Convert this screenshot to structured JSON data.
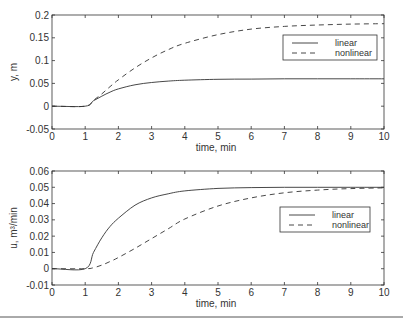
{
  "chart_data": [
    {
      "type": "line",
      "title": "",
      "xlabel": "time, min",
      "ylabel": "y, m",
      "xlim": [
        0,
        10
      ],
      "ylim": [
        -0.05,
        0.2
      ],
      "xticks": [
        "0",
        "1",
        "2",
        "3",
        "4",
        "5",
        "6",
        "7",
        "8",
        "9",
        "10"
      ],
      "yticks": [
        "-0.05",
        "0",
        "0.05",
        "0.1",
        "0.15",
        "0.2"
      ],
      "grid": false,
      "legend_position": "upper right",
      "x": [
        0,
        1,
        1.25,
        1.5,
        1.75,
        2,
        2.5,
        3,
        3.5,
        4,
        5,
        6,
        7,
        8,
        9,
        10
      ],
      "series": [
        {
          "name": "linear",
          "style": "solid",
          "values": [
            0,
            0,
            0.012,
            0.022,
            0.031,
            0.038,
            0.047,
            0.052,
            0.055,
            0.057,
            0.059,
            0.0595,
            0.06,
            0.06,
            0.06,
            0.06
          ]
        },
        {
          "name": "nonlinear",
          "style": "dashed",
          "values": [
            0,
            0,
            0.013,
            0.027,
            0.043,
            0.058,
            0.084,
            0.106,
            0.124,
            0.138,
            0.157,
            0.169,
            0.175,
            0.178,
            0.18,
            0.181
          ]
        }
      ]
    },
    {
      "type": "line",
      "title": "",
      "xlabel": "time, min",
      "ylabel": "u, m³/min",
      "xlim": [
        0,
        10
      ],
      "ylim": [
        -0.01,
        0.06
      ],
      "xticks": [
        "0",
        "1",
        "2",
        "3",
        "4",
        "5",
        "6",
        "7",
        "8",
        "9",
        "10"
      ],
      "yticks": [
        "-0.01",
        "0",
        "0.01",
        "0.02",
        "0.03",
        "0.04",
        "0.05",
        "0.06"
      ],
      "grid": false,
      "legend_position": "right",
      "x": [
        0,
        1,
        1.25,
        1.5,
        1.75,
        2,
        2.5,
        3,
        3.5,
        4,
        5,
        6,
        7,
        8,
        9,
        10
      ],
      "series": [
        {
          "name": "linear",
          "style": "solid",
          "values": [
            0,
            0,
            0.01,
            0.019,
            0.026,
            0.031,
            0.039,
            0.0435,
            0.046,
            0.0478,
            0.0493,
            0.0498,
            0.05,
            0.05,
            0.05,
            0.05
          ]
        },
        {
          "name": "nonlinear",
          "style": "dashed",
          "values": [
            0,
            0,
            0.0006,
            0.0022,
            0.0044,
            0.0069,
            0.0125,
            0.0185,
            0.0245,
            0.0305,
            0.0385,
            0.0435,
            0.0466,
            0.0483,
            0.0492,
            0.0496
          ]
        }
      ]
    }
  ],
  "colors": {
    "axis": "#333333",
    "line": "#333333",
    "background": "#ffffff",
    "rule": "#555555"
  }
}
